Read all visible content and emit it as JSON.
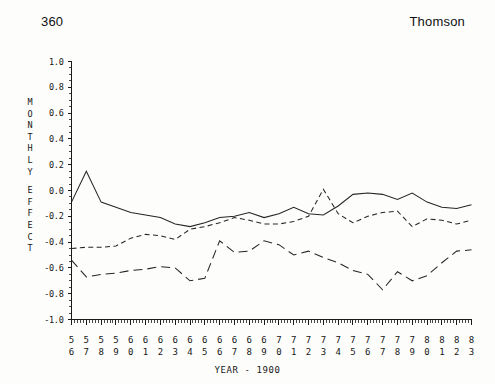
{
  "header": {
    "page_number": "360",
    "corner_title": "Thomson"
  },
  "axis": {
    "ylabel_text": "MONTHLY EFFECT",
    "ylabel_chars": [
      "M",
      "O",
      "N",
      "T",
      "H",
      "L",
      "Y",
      "",
      "E",
      "F",
      "F",
      "E",
      "C",
      "T"
    ],
    "xlabel": "YEAR - 1900"
  },
  "chart_data": {
    "type": "line",
    "title": "",
    "subtitle": "",
    "xlabel": "YEAR - 1900",
    "ylabel": "MONTHLY EFFECT",
    "xlim": [
      56,
      83
    ],
    "ylim": [
      -1.0,
      1.0
    ],
    "grid": false,
    "legend": "none",
    "ytick_labels": [
      "1.0",
      "0.8",
      "0.6",
      "0.4",
      "0.2",
      "0.0",
      "-0.2",
      "-0.4",
      "-0.6",
      "-0.8",
      "-1.0"
    ],
    "ytick_values": [
      1.0,
      0.8,
      0.6,
      0.4,
      0.2,
      0.0,
      -0.2,
      -0.4,
      -0.6,
      -0.8,
      -1.0
    ],
    "xtick_labels_top": [
      "5",
      "5",
      "5",
      "5",
      "6",
      "6",
      "6",
      "6",
      "6",
      "6",
      "6",
      "6",
      "6",
      "6",
      "7",
      "7",
      "7",
      "7",
      "7",
      "7",
      "7",
      "7",
      "7",
      "7",
      "8",
      "8",
      "8",
      "8"
    ],
    "xtick_labels_bottom": [
      "6",
      "7",
      "8",
      "9",
      "0",
      "1",
      "2",
      "3",
      "4",
      "5",
      "6",
      "7",
      "8",
      "9",
      "0",
      "1",
      "2",
      "3",
      "4",
      "5",
      "6",
      "7",
      "8",
      "9",
      "0",
      "1",
      "2",
      "3"
    ],
    "x": [
      56,
      57,
      58,
      59,
      60,
      61,
      62,
      63,
      64,
      65,
      66,
      67,
      68,
      69,
      70,
      71,
      72,
      73,
      74,
      75,
      76,
      77,
      78,
      79,
      80,
      81,
      82,
      83
    ],
    "minor_ticks_per_interval": 4,
    "series": [
      {
        "name": "solid",
        "style": "solid",
        "values": [
          -0.09,
          0.15,
          -0.09,
          -0.13,
          -0.17,
          -0.19,
          -0.21,
          -0.26,
          -0.28,
          -0.25,
          -0.21,
          -0.2,
          -0.17,
          -0.21,
          -0.18,
          -0.13,
          -0.18,
          -0.19,
          -0.12,
          -0.03,
          -0.02,
          -0.03,
          -0.07,
          -0.02,
          -0.09,
          -0.13,
          -0.14,
          -0.11
        ]
      },
      {
        "name": "short-dash",
        "style": "dashed",
        "values": [
          -0.45,
          -0.44,
          -0.44,
          -0.43,
          -0.37,
          -0.34,
          -0.35,
          -0.38,
          -0.3,
          -0.28,
          -0.25,
          -0.21,
          -0.23,
          -0.26,
          -0.26,
          -0.24,
          -0.2,
          0.01,
          -0.18,
          -0.25,
          -0.2,
          -0.17,
          -0.16,
          -0.28,
          -0.22,
          -0.23,
          -0.26,
          -0.23
        ]
      },
      {
        "name": "long-dash",
        "style": "long-dash",
        "values": [
          -0.54,
          -0.67,
          -0.65,
          -0.64,
          -0.62,
          -0.61,
          -0.59,
          -0.6,
          -0.7,
          -0.68,
          -0.39,
          -0.48,
          -0.47,
          -0.39,
          -0.42,
          -0.5,
          -0.47,
          -0.52,
          -0.56,
          -0.62,
          -0.65,
          -0.77,
          -0.63,
          -0.7,
          -0.66,
          -0.56,
          -0.47,
          -0.46
        ]
      }
    ]
  }
}
